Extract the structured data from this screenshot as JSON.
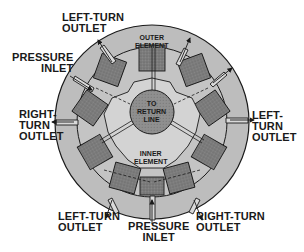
{
  "diagram": {
    "colors": {
      "background": "#ffffff",
      "housing": "#bdbdbd",
      "outer_element": "#a9a9a9",
      "lobes": "#7d7d7d",
      "inner_element": "#cfcfcf",
      "return_line": "#8f8f8f",
      "outline": "#1a1a1a"
    },
    "labels": {
      "top_left_left_turn_outlet": "LEFT-TURN\nOUTLET",
      "left_pressure_inlet": "PRESSURE\nINLET",
      "left_right_turn_outlet": "RIGHT-\nTURN\nOUTLET",
      "right_left_turn_outlet": "LEFT-\nTURN\nOUTLET",
      "bottom_left_left_turn_outlet": "LEFT-TURN\nOUTLET",
      "bottom_pressure_inlet": "PRESSURE\nINLET",
      "bottom_right_right_turn_outlet": "RIGHT-TURN\nOUTLET"
    },
    "inner_labels": {
      "outer_element": "OUTER\nELEMENT",
      "return_line": "TO\nRETURN\nLINE",
      "inner_element": "INNER\nELEMENT"
    }
  }
}
